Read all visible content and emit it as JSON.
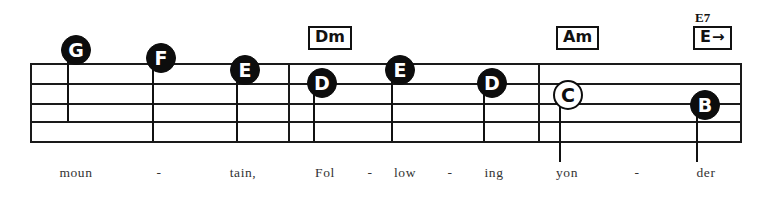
{
  "sheet": {
    "title": "Folk song staff excerpt",
    "ink_color": "#111111",
    "paper_color": "#ffffff"
  },
  "staff": {
    "left": 30,
    "right": 742,
    "line_ys": [
      63,
      83,
      103,
      121,
      141
    ],
    "line_count": 5,
    "barlines": [
      288,
      538
    ]
  },
  "notes": [
    {
      "label": "G",
      "style": "filled",
      "x": 76,
      "y": 50,
      "stem_bottom": 121
    },
    {
      "label": "F",
      "style": "filled",
      "x": 161,
      "y": 58,
      "stem_bottom": 141
    },
    {
      "label": "E",
      "style": "filled",
      "x": 245,
      "y": 70,
      "stem_bottom": 141
    },
    {
      "label": "D",
      "style": "filled",
      "x": 322,
      "y": 83,
      "stem_bottom": 141
    },
    {
      "label": "E",
      "style": "filled",
      "x": 400,
      "y": 70,
      "stem_bottom": 141
    },
    {
      "label": "D",
      "style": "filled",
      "x": 492,
      "y": 83,
      "stem_bottom": 141
    },
    {
      "label": "C",
      "style": "hollow",
      "x": 568,
      "y": 95,
      "stem_bottom": 162
    },
    {
      "label": "B",
      "style": "filled",
      "x": 705,
      "y": 105,
      "stem_bottom": 162
    }
  ],
  "chords": [
    {
      "name": "Dm",
      "text": "Dm",
      "superscript": "",
      "arrow": false,
      "x": 308,
      "y": 26
    },
    {
      "name": "Am",
      "text": "Am",
      "superscript": "",
      "arrow": false,
      "x": 556,
      "y": 26
    },
    {
      "name": "E7",
      "text": "E",
      "superscript": "E7",
      "arrow": true,
      "x": 693,
      "y": 26
    }
  ],
  "lyrics": [
    {
      "text": "moun",
      "x": 76
    },
    {
      "text": "-",
      "x": 161
    },
    {
      "text": "tain,",
      "x": 245
    },
    {
      "text": "Fol",
      "x": 322
    },
    {
      "text": "-",
      "x": 400
    },
    {
      "text": "low",
      "x": 400
    },
    {
      "text": "-",
      "x": 449
    },
    {
      "text": "ing",
      "x": 492
    },
    {
      "text": "yon",
      "x": 568
    },
    {
      "text": "-",
      "x": 637
    },
    {
      "text": "der",
      "x": 705
    }
  ],
  "lyrics_layout": {
    "baseline_y": 176,
    "line_text": "moun - tain, Fol - low - ing yon - der"
  },
  "lyrics_items": [
    {
      "text": "moun",
      "x": 76
    },
    {
      "text": "-",
      "x": 159
    },
    {
      "text": "tain,",
      "x": 243
    },
    {
      "text": "Fol",
      "x": 325
    },
    {
      "text": "-",
      "x": 370
    },
    {
      "text": "low",
      "x": 405
    },
    {
      "text": "-",
      "x": 450
    },
    {
      "text": "ing",
      "x": 494
    },
    {
      "text": "yon",
      "x": 567
    },
    {
      "text": "-",
      "x": 637
    },
    {
      "text": "der",
      "x": 706
    }
  ],
  "arrow_char": "→"
}
